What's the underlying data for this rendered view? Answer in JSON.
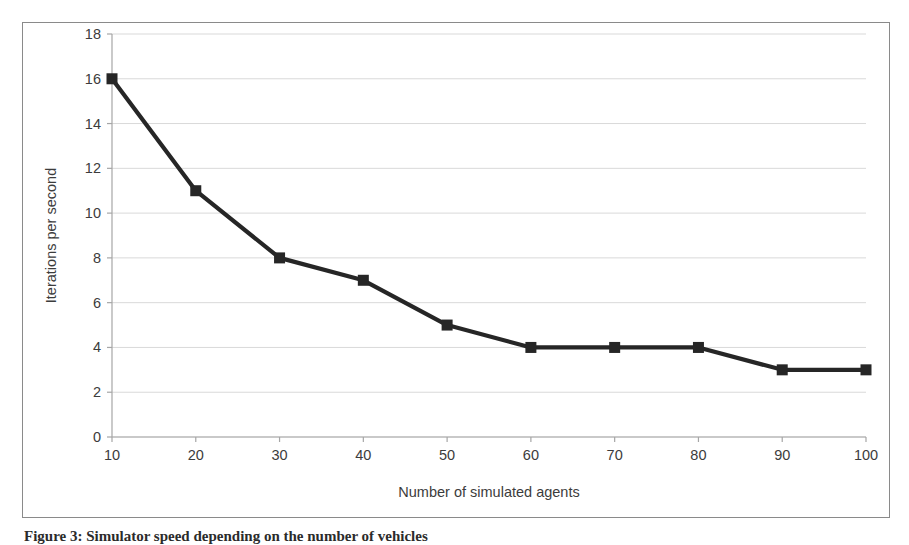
{
  "figure": {
    "caption": "Figure 3: Simulator speed depending on the number of vehicles"
  },
  "chart_data": {
    "type": "line",
    "title": "",
    "xlabel": "Number of simulated agents",
    "ylabel": "Iterations per second",
    "x": [
      10,
      20,
      30,
      40,
      50,
      60,
      70,
      80,
      90,
      100
    ],
    "values": [
      16,
      11,
      8,
      7,
      5,
      4,
      4,
      4,
      3,
      3
    ],
    "xtick_labels": [
      "10",
      "20",
      "30",
      "40",
      "50",
      "60",
      "70",
      "80",
      "90",
      "100"
    ],
    "ytick_labels": [
      "0",
      "2",
      "4",
      "6",
      "8",
      "10",
      "12",
      "14",
      "16",
      "18"
    ],
    "yticks": [
      0,
      2,
      4,
      6,
      8,
      10,
      12,
      14,
      16,
      18
    ],
    "xlim": [
      10,
      100
    ],
    "ylim": [
      0,
      18
    ],
    "grid": "horizontal",
    "legend": "none",
    "marker": "square",
    "series_color": "#262626",
    "grid_color": "#d9d9d9",
    "axis_color": "#a6a6a6",
    "text_color": "#3c3c3c"
  }
}
